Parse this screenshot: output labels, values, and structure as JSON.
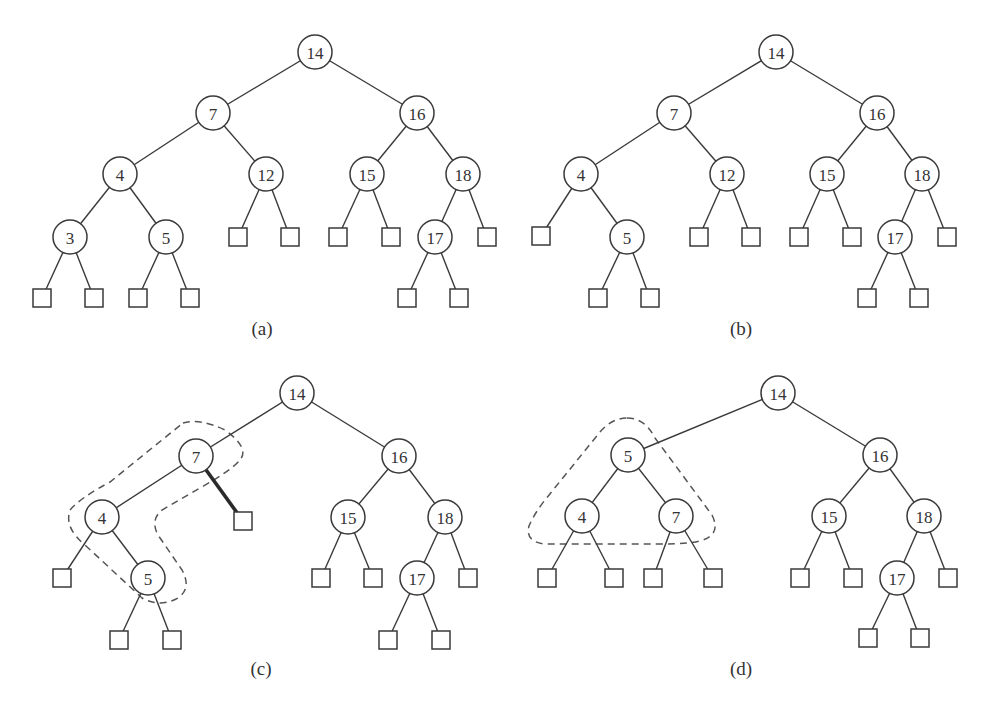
{
  "figure": {
    "panels": [
      {
        "id": "a",
        "caption": "(a)",
        "nodes": [
          "14",
          "7",
          "16",
          "4",
          "12",
          "15",
          "18",
          "3",
          "5",
          "17"
        ],
        "tree": {
          "key": "14",
          "left": {
            "key": "7",
            "left": {
              "key": "4",
              "left": {
                "key": "3",
                "left": null,
                "right": null
              },
              "right": {
                "key": "5",
                "left": null,
                "right": null
              }
            },
            "right": {
              "key": "12",
              "left": null,
              "right": null
            }
          },
          "right": {
            "key": "16",
            "left": {
              "key": "15",
              "left": null,
              "right": null
            },
            "right": {
              "key": "18",
              "left": {
                "key": "17",
                "left": null,
                "right": null
              },
              "right": null
            }
          }
        }
      },
      {
        "id": "b",
        "caption": "(b)",
        "nodes": [
          "14",
          "7",
          "16",
          "4",
          "12",
          "15",
          "18",
          "5",
          "17"
        ],
        "tree": {
          "key": "14",
          "left": {
            "key": "7",
            "left": {
              "key": "4",
              "left": null,
              "right": {
                "key": "5",
                "left": null,
                "right": null
              }
            },
            "right": {
              "key": "12",
              "left": null,
              "right": null
            }
          },
          "right": {
            "key": "16",
            "left": {
              "key": "15",
              "left": null,
              "right": null
            },
            "right": {
              "key": "18",
              "left": {
                "key": "17",
                "left": null,
                "right": null
              },
              "right": null
            }
          }
        }
      },
      {
        "id": "c",
        "caption": "(c)",
        "nodes": [
          "14",
          "7",
          "16",
          "4",
          "15",
          "18",
          "5",
          "17"
        ],
        "highlight": {
          "dashed_outline": [
            "7",
            "4",
            "5"
          ],
          "bold_edge": "7 → right external node"
        },
        "tree": {
          "key": "14",
          "left": {
            "key": "7",
            "left": {
              "key": "4",
              "left": null,
              "right": {
                "key": "5",
                "left": null,
                "right": null
              }
            },
            "right": null
          },
          "right": {
            "key": "16",
            "left": {
              "key": "15",
              "left": null,
              "right": null
            },
            "right": {
              "key": "18",
              "left": {
                "key": "17",
                "left": null,
                "right": null
              },
              "right": null
            }
          }
        }
      },
      {
        "id": "d",
        "caption": "(d)",
        "nodes": [
          "14",
          "5",
          "16",
          "4",
          "7",
          "15",
          "18",
          "17"
        ],
        "highlight": {
          "dashed_outline": [
            "5",
            "4",
            "7"
          ]
        },
        "tree": {
          "key": "14",
          "left": {
            "key": "5",
            "left": {
              "key": "4",
              "left": null,
              "right": null
            },
            "right": {
              "key": "7",
              "left": null,
              "right": null
            }
          },
          "right": {
            "key": "16",
            "left": {
              "key": "15",
              "left": null,
              "right": null
            },
            "right": {
              "key": "18",
              "left": {
                "key": "17",
                "left": null,
                "right": null
              },
              "right": null
            }
          }
        }
      }
    ]
  }
}
